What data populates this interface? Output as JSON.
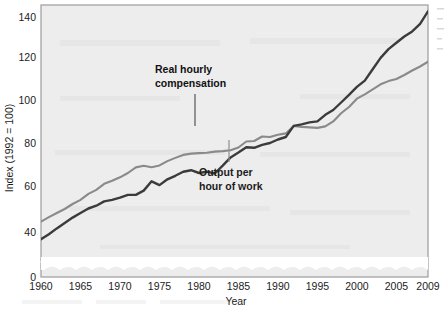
{
  "chart_data": {
    "type": "line",
    "title": "",
    "xlabel": "Year",
    "ylabel": "Index (1992 = 100)",
    "xlim": [
      1960,
      2009
    ],
    "ylim": [
      40,
      148
    ],
    "y_axis_break": true,
    "y_axis_break_note": "wavy break between 0 and 40",
    "grid": false,
    "legend_position": "inline-annotations",
    "ytick_labels": [
      "0",
      "40",
      "60",
      "80",
      "100",
      "120",
      "140"
    ],
    "ytick_values": [
      0,
      40,
      60,
      80,
      100,
      120,
      140
    ],
    "xtick_labels": [
      "1960",
      "1965",
      "1970",
      "1975",
      "1980",
      "1985",
      "1990",
      "1995",
      "2000",
      "2005",
      "2009"
    ],
    "xtick_values": [
      1960,
      1965,
      1970,
      1975,
      1980,
      1985,
      1990,
      1995,
      2000,
      2005,
      2009
    ],
    "x": [
      1960,
      1961,
      1962,
      1963,
      1964,
      1965,
      1966,
      1967,
      1968,
      1969,
      1970,
      1971,
      1972,
      1973,
      1974,
      1975,
      1976,
      1977,
      1978,
      1979,
      1980,
      1981,
      1982,
      1983,
      1984,
      1985,
      1986,
      1987,
      1988,
      1989,
      1990,
      1991,
      1992,
      1993,
      1994,
      1995,
      1996,
      1997,
      1998,
      1999,
      2000,
      2001,
      2002,
      2003,
      2004,
      2005,
      2006,
      2007,
      2008,
      2009
    ],
    "series": [
      {
        "name": "Output per hour of work",
        "color": "#3b3b3b",
        "values": [
          55.0,
          57.0,
          59.3,
          61.5,
          63.6,
          65.4,
          67.2,
          68.3,
          70.0,
          70.6,
          71.5,
          72.6,
          72.6,
          74.3,
          78.0,
          76.5,
          78.8,
          80.2,
          81.8,
          82.4,
          81.3,
          81.8,
          81.1,
          84.2,
          87.5,
          89.4,
          91.5,
          91.3,
          92.5,
          93.2,
          94.6,
          95.6,
          100.0,
          100.6,
          101.4,
          101.8,
          104.4,
          106.3,
          109.3,
          112.3,
          115.5,
          118.0,
          122.5,
          127.0,
          130.5,
          133.0,
          135.5,
          137.5,
          140.5,
          145.5
        ]
      },
      {
        "name": "Real hourly compensation",
        "color": "#8a8a8a",
        "values": [
          62.0,
          63.8,
          65.4,
          67.0,
          69.0,
          70.6,
          73.0,
          74.6,
          77.0,
          78.2,
          79.6,
          81.3,
          83.5,
          84.2,
          83.6,
          84.3,
          86.0,
          87.3,
          88.5,
          89.0,
          89.2,
          89.3,
          89.8,
          90.0,
          90.3,
          91.4,
          93.8,
          94.0,
          95.8,
          95.6,
          96.5,
          97.0,
          100.0,
          99.6,
          99.4,
          99.2,
          99.8,
          101.8,
          105.0,
          107.5,
          110.8,
          112.5,
          114.5,
          116.5,
          117.8,
          118.6,
          120.2,
          122.0,
          123.6,
          125.5
        ]
      }
    ],
    "annotations": [
      {
        "id": "real-hourly-compensation",
        "lines": [
          "Real hourly",
          "compensation"
        ],
        "target_year": 1979,
        "target_value": 89.0,
        "emphasis": "bold"
      },
      {
        "id": "output-per-hour-of-work",
        "lines": [
          "Output per",
          "hour of work"
        ],
        "target_year": 1983,
        "target_value": 84.2,
        "emphasis": "bold"
      }
    ]
  },
  "figure": {
    "background": "#ffffff",
    "plot_background": "#ededed",
    "plot_border_color": "#9a9a9a",
    "axis_break_color": "#ffffff"
  }
}
